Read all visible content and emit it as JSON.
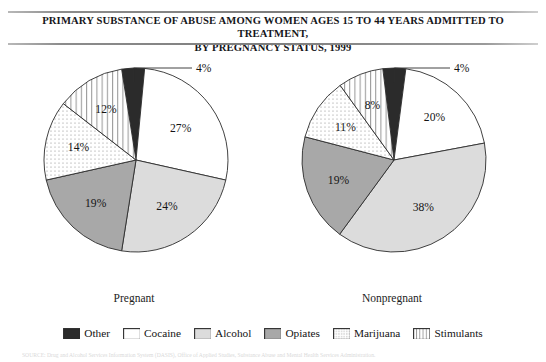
{
  "title": {
    "line1": "PRIMARY SUBSTANCE OF ABUSE AMONG WOMEN AGES 15 TO 44 YEARS ADMITTED TO TREATMENT,",
    "line2": "BY PREGNANCY STATUS, 1999"
  },
  "source": {
    "text": "SOURCE: Drug and Alcohol Services Information System (DASIS), Office of Applied Studies, Substance Abuse and Mental Health Services Administration."
  },
  "legend": {
    "items": [
      {
        "label": "Other",
        "pattern": "solid-black",
        "color": "#2b2b2b",
        "swatch_name": "legend-swatch-other"
      },
      {
        "label": "Cocaine",
        "pattern": "solid-white",
        "color": "#ffffff",
        "swatch_name": "legend-swatch-cocaine"
      },
      {
        "label": "Alcohol",
        "pattern": "solid-light-gray",
        "color": "#dcdcdc",
        "swatch_name": "legend-swatch-alcohol"
      },
      {
        "label": "Opiates",
        "pattern": "solid-mid-gray",
        "color": "#a8a8a8",
        "swatch_name": "legend-swatch-opiates"
      },
      {
        "label": "Marijuana",
        "pattern": "dots",
        "color": "#ffffff",
        "swatch_name": "legend-swatch-marijuana"
      },
      {
        "label": "Stimulants",
        "pattern": "vertical-lines",
        "color": "#ffffff",
        "swatch_name": "legend-swatch-stimulants"
      }
    ]
  },
  "chart_data": [
    {
      "type": "pie",
      "title": "Pregnant",
      "categories": [
        "Other",
        "Cocaine",
        "Alcohol",
        "Opiates",
        "Marijuana",
        "Stimulants"
      ],
      "values": [
        4,
        27,
        24,
        19,
        14,
        12
      ],
      "labels": [
        "4%",
        "27%",
        "24%",
        "19%",
        "14%",
        "12%"
      ],
      "unit": "%",
      "start_angle_deg": -9,
      "direction": "clockwise",
      "callout_slices": [
        "Other"
      ],
      "legend_position": "bottom"
    },
    {
      "type": "pie",
      "title": "Nonpregnant",
      "categories": [
        "Other",
        "Cocaine",
        "Alcohol",
        "Opiates",
        "Marijuana",
        "Stimulants"
      ],
      "values": [
        4,
        20,
        38,
        19,
        11,
        8
      ],
      "labels": [
        "4%",
        "20%",
        "38%",
        "19%",
        "11%",
        "8%"
      ],
      "unit": "%",
      "start_angle_deg": -7,
      "direction": "clockwise",
      "callout_slices": [
        "Other"
      ],
      "legend_position": "bottom"
    }
  ]
}
